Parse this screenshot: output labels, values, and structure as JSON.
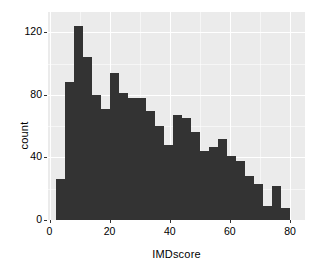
{
  "chart_data": {
    "type": "bar",
    "title": "",
    "subtitle": "",
    "xlabel": "IMDscore",
    "ylabel": "count",
    "xlim": [
      -0.5,
      85
    ],
    "ylim": [
      0,
      133
    ],
    "grid": true,
    "legend": null,
    "bin_width": 3,
    "x_ticks": [
      0,
      20,
      40,
      60,
      80
    ],
    "x_tick_labels": [
      "0",
      "20",
      "40",
      "60",
      "80"
    ],
    "y_ticks": [
      0,
      40,
      80,
      120
    ],
    "y_tick_labels": [
      "0",
      "40",
      "80",
      "120"
    ],
    "bin_starts": [
      2,
      5,
      8,
      11,
      14,
      17,
      20,
      23,
      26,
      29,
      32,
      35,
      38,
      41,
      44,
      47,
      50,
      53,
      56,
      59,
      62,
      65,
      68,
      71,
      74,
      77
    ],
    "values": [
      26,
      88,
      124,
      104,
      80,
      71,
      94,
      81,
      78,
      78,
      70,
      60,
      48,
      67,
      65,
      56,
      44,
      47,
      52,
      41,
      38,
      28,
      23,
      9,
      22,
      8
    ],
    "bar_color": "#333333",
    "panel_color": "#ebebeb",
    "gridline_color": "#ffffff"
  },
  "axes": {
    "x_title": "IMDscore",
    "y_title": "count"
  }
}
